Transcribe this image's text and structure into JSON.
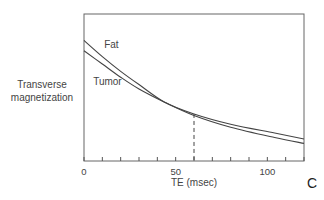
{
  "chart_data": {
    "type": "line",
    "title": "",
    "panel_label": "C",
    "xlabel": "TE (msec)",
    "ylabel": [
      "Transverse",
      "magnetization"
    ],
    "xlim": [
      0,
      120
    ],
    "ylim": [
      0,
      1
    ],
    "x_ticks_major": [
      0,
      50,
      100
    ],
    "x_tick_labels": [
      "0",
      "50",
      "100"
    ],
    "x_ticks_minor_step": 10,
    "y_ticks": [],
    "grid": false,
    "legend": "inline labels",
    "annotations": [
      {
        "type": "vertical-dashed-line",
        "x": 60,
        "from_curve_to_axis": true
      }
    ],
    "series": [
      {
        "name": "Fat",
        "label_pos": {
          "x": 11,
          "y": 0.77
        },
        "x": [
          0,
          10,
          20,
          30,
          44,
          60,
          80,
          104,
          120
        ],
        "values": [
          0.82,
          0.71,
          0.61,
          0.52,
          0.4,
          0.32,
          0.25,
          0.19,
          0.15
        ]
      },
      {
        "name": "Tumor",
        "label_pos": {
          "x": 5,
          "y": 0.52
        },
        "x": [
          0,
          10,
          20,
          30,
          44,
          60,
          80,
          104,
          120
        ],
        "values": [
          0.75,
          0.66,
          0.57,
          0.49,
          0.4,
          0.31,
          0.23,
          0.16,
          0.12
        ]
      }
    ],
    "colors": {
      "line": "#444444",
      "axis": "#555555",
      "background": "#ffffff"
    }
  }
}
